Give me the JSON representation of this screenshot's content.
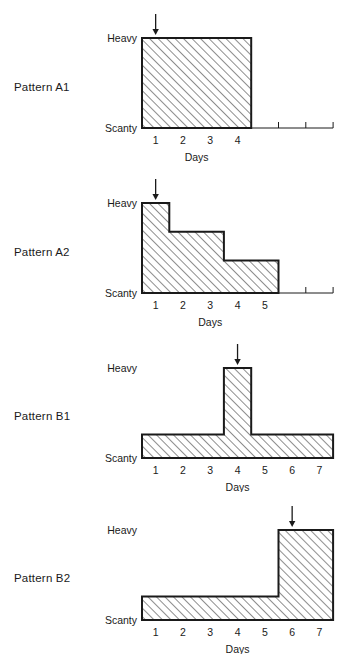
{
  "figure": {
    "title": "",
    "axis_title": "Days",
    "level_labels": {
      "high": "Heavy",
      "low": "Scanty"
    }
  },
  "chart_data": {
    "type": "area",
    "xlabel": "Days",
    "ylabel": "",
    "ylim": [
      0,
      1
    ],
    "y_tick_labels": [
      "Scanty",
      "Heavy"
    ],
    "grid": false,
    "legend": null,
    "panels": [
      {
        "name": "Pattern A1",
        "label": "Pattern A1",
        "x_ticks": [
          1,
          2,
          3,
          4
        ],
        "x_axis_range": [
          0.5,
          7.5
        ],
        "arrow_at_day": 1,
        "arrow_label": "onset-arrow",
        "steps": [
          {
            "from": 0.5,
            "to": 4.5,
            "level": 1.0
          }
        ]
      },
      {
        "name": "Pattern A2",
        "label": "Pattern A2",
        "x_ticks": [
          1,
          2,
          3,
          4,
          5
        ],
        "x_axis_range": [
          0.5,
          7.5
        ],
        "arrow_at_day": 1,
        "arrow_label": "onset-arrow",
        "steps": [
          {
            "from": 0.5,
            "to": 1.5,
            "level": 1.0
          },
          {
            "from": 1.5,
            "to": 3.5,
            "level": 0.68
          },
          {
            "from": 3.5,
            "to": 5.5,
            "level": 0.36
          }
        ]
      },
      {
        "name": "Pattern B1",
        "label": "Pattern B1",
        "x_ticks": [
          1,
          2,
          3,
          4,
          5,
          6,
          7
        ],
        "x_axis_range": [
          0.5,
          7.5
        ],
        "arrow_at_day": 4,
        "arrow_label": "peak-arrow",
        "steps": [
          {
            "from": 0.5,
            "to": 3.5,
            "level": 0.26
          },
          {
            "from": 3.5,
            "to": 4.5,
            "level": 1.0
          },
          {
            "from": 4.5,
            "to": 7.5,
            "level": 0.26
          }
        ]
      },
      {
        "name": "Pattern B2",
        "label": "Pattern B2",
        "x_ticks": [
          1,
          2,
          3,
          4,
          5,
          6,
          7
        ],
        "x_axis_range": [
          0.5,
          7.5
        ],
        "arrow_at_day": 6,
        "arrow_label": "peak-arrow",
        "steps": [
          {
            "from": 0.5,
            "to": 5.5,
            "level": 0.26
          },
          {
            "from": 5.5,
            "to": 7.5,
            "level": 1.0
          }
        ]
      }
    ]
  },
  "colors": {
    "ink": "#1a1a1a",
    "hatch": "#3a3a3a",
    "fill": "#ffffff",
    "background": "#ffffff"
  }
}
